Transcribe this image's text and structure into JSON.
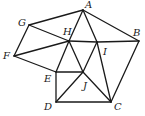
{
  "figure": {
    "type": "geometry",
    "points": [
      {
        "id": "A",
        "x": 83,
        "y": 10,
        "lx": 85,
        "ly": 8
      },
      {
        "id": "B",
        "x": 139,
        "y": 41,
        "lx": 133,
        "ly": 36
      },
      {
        "id": "C",
        "x": 111,
        "y": 102,
        "lx": 114,
        "ly": 110
      },
      {
        "id": "D",
        "x": 56,
        "y": 102,
        "lx": 44,
        "ly": 110
      },
      {
        "id": "E",
        "x": 56,
        "y": 72,
        "lx": 44,
        "ly": 82
      },
      {
        "id": "F",
        "x": 14,
        "y": 56,
        "lx": 3,
        "ly": 59
      },
      {
        "id": "G",
        "x": 29,
        "y": 25,
        "lx": 18,
        "ly": 26
      },
      {
        "id": "H",
        "x": 69,
        "y": 41,
        "lx": 63,
        "ly": 35
      },
      {
        "id": "I",
        "x": 97,
        "y": 42,
        "lx": 103,
        "ly": 55
      },
      {
        "id": "J",
        "x": 83,
        "y": 72,
        "lx": 83,
        "ly": 89
      }
    ],
    "edges": [
      [
        "A",
        "G"
      ],
      [
        "G",
        "F"
      ],
      [
        "G",
        "H"
      ],
      [
        "F",
        "H"
      ],
      [
        "F",
        "E"
      ],
      [
        "E",
        "H"
      ],
      [
        "E",
        "D"
      ],
      [
        "E",
        "J"
      ],
      [
        "D",
        "C"
      ],
      [
        "D",
        "J"
      ],
      [
        "J",
        "H"
      ],
      [
        "J",
        "I"
      ],
      [
        "J",
        "C"
      ],
      [
        "H",
        "A"
      ],
      [
        "H",
        "I"
      ],
      [
        "I",
        "B"
      ],
      [
        "A",
        "I"
      ],
      [
        "A",
        "B"
      ],
      [
        "I",
        "C"
      ],
      [
        "B",
        "C"
      ]
    ],
    "line_color": "#1a1a1a"
  }
}
